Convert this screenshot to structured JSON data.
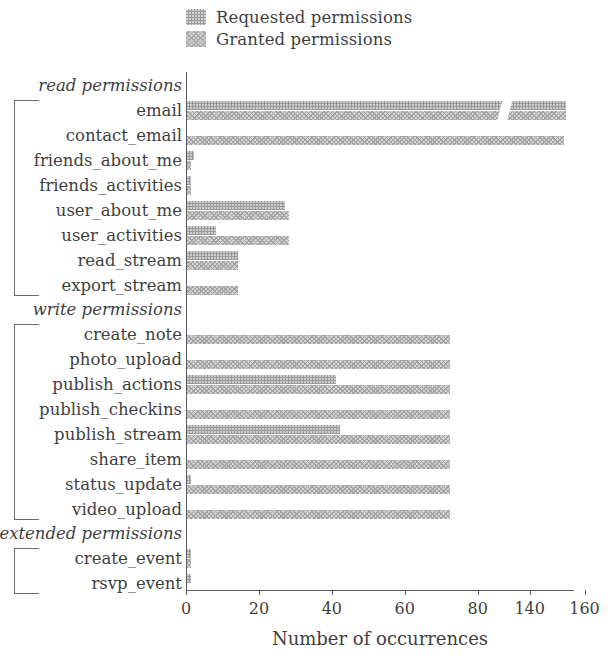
{
  "legend": {
    "items": [
      {
        "label": "Requested permissions",
        "swatch": "requested-swatch",
        "color": "#9a9a9a"
      },
      {
        "label": "Granted permissions",
        "swatch": "granted-swatch",
        "color": "#cfcfcf"
      }
    ]
  },
  "axis": {
    "xlabel": "Number of occurrences",
    "xticks": [
      "0",
      "20",
      "40",
      "60",
      "80",
      "140",
      "160"
    ],
    "break_after": "80"
  },
  "groups": [
    {
      "label": "read permissions",
      "count": 8
    },
    {
      "label": "write permissions",
      "count": 8
    },
    {
      "label": "extended permissions",
      "count": 2
    }
  ],
  "chart_data": {
    "type": "bar",
    "orientation": "horizontal",
    "title": "",
    "xlabel": "Number of occurrences",
    "ylabel": "",
    "xlim": [
      0,
      160
    ],
    "xticks": [
      0,
      20,
      40,
      60,
      80,
      140,
      160
    ],
    "axis_break": {
      "from": 85,
      "to": 135
    },
    "grid": false,
    "legend_position": "top-left",
    "group_labels": [
      "read permissions",
      "write permissions",
      "extended permissions"
    ],
    "categories": [
      "email",
      "contact_email",
      "friends_about_me",
      "friends_activities",
      "user_about_me",
      "user_activities",
      "read_stream",
      "export_stream",
      "create_note",
      "photo_upload",
      "publish_actions",
      "publish_checkins",
      "publish_stream",
      "share_item",
      "status_update",
      "video_upload",
      "create_event",
      "rsvp_event"
    ],
    "category_groups": [
      "read permissions",
      "read permissions",
      "read permissions",
      "read permissions",
      "read permissions",
      "read permissions",
      "read permissions",
      "read permissions",
      "write permissions",
      "write permissions",
      "write permissions",
      "write permissions",
      "write permissions",
      "write permissions",
      "write permissions",
      "write permissions",
      "extended permissions",
      "extended permissions"
    ],
    "series": [
      {
        "name": "Requested permissions",
        "values": [
          153,
          0,
          2,
          1,
          27,
          8,
          14,
          0,
          0,
          0,
          41,
          0,
          42,
          0,
          1,
          0,
          1,
          1
        ]
      },
      {
        "name": "Granted permissions",
        "values": [
          153,
          152,
          1,
          1,
          28,
          28,
          14,
          14,
          72,
          72,
          72,
          72,
          72,
          72,
          72,
          72,
          1,
          0
        ]
      }
    ]
  }
}
